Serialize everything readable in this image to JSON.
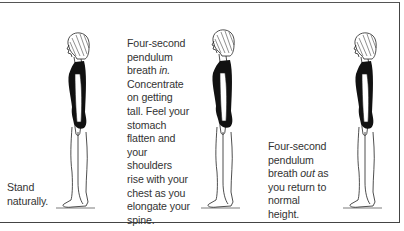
{
  "panels": [
    {
      "id": "stand",
      "caption_lines": [
        "Stand",
        "naturally."
      ],
      "figure": "standing-woman-relaxed"
    },
    {
      "id": "breath-in",
      "caption_lines": [
        "Four-second",
        "pendulum",
        "breath ",
        "Concentrate",
        "on getting",
        "tall. Feel your",
        "stomach",
        "flatten and",
        "your",
        "shoulders",
        "rise with your",
        "chest as you",
        "elongate your",
        "spine."
      ],
      "caption_emphasis": "in.",
      "figure": "standing-woman-tall"
    },
    {
      "id": "breath-out",
      "caption_lines": [
        "Four-second",
        "pendulum",
        "breath ",
        "you return to",
        "normal",
        "height."
      ],
      "caption_emphasis": "out",
      "caption_emphasis_suffix": " as",
      "figure": "standing-woman-relaxed"
    }
  ],
  "colors": {
    "ink": "#111111",
    "text": "#333333",
    "border": "#444444"
  }
}
